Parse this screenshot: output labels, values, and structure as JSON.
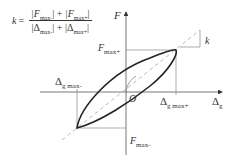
{
  "diagram": {
    "type": "hysteresis-loop",
    "formula": {
      "lhs": "k",
      "equals": "=",
      "numerator": {
        "a": "|F",
        "a_sub": "max-",
        "a_end": "|",
        "plus": " + ",
        "b": "|F",
        "b_sub": "max+",
        "b_end": "|"
      },
      "denominator": {
        "a": "|Δ",
        "a_sub": "max-",
        "a_end": "|",
        "plus": " + ",
        "b": "|Δ",
        "b_sub": "max+",
        "b_end": "|"
      }
    },
    "labels": {
      "y_axis": "F",
      "x_axis": "Δ",
      "x_axis_sub": "g",
      "origin": "O",
      "f_max_pos": "F",
      "f_max_pos_sub": "max+",
      "f_max_neg": "F",
      "f_max_neg_sub": "max-",
      "d_max_neg": "Δ",
      "d_max_neg_sub": "g max-",
      "d_max_pos": "Δ",
      "d_max_pos_sub": "g max+",
      "slope": "k"
    },
    "colors": {
      "line": "#333333",
      "dashed": "#aaaaaa",
      "guide": "#888888"
    }
  }
}
